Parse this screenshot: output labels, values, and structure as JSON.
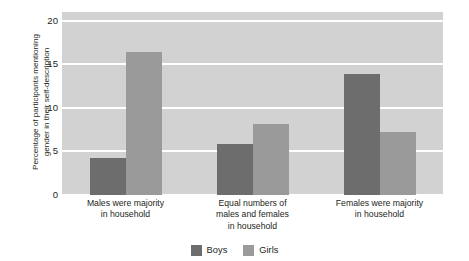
{
  "chart_data": {
    "type": "bar",
    "title": "",
    "xlabel": "",
    "ylabel": "Percentage of participants mentioning gender in their self-description",
    "ylabel_line1": "Percentage of participants mentioning",
    "ylabel_line2": "gender in their self-description",
    "categories": [
      "Males were majority in household",
      "Equal numbers of males and females in household",
      "Females were majority in household"
    ],
    "category_lines": [
      [
        "Males were majority",
        "in household"
      ],
      [
        "Equal numbers of",
        "males and females",
        "in household"
      ],
      [
        "Females were majority",
        "in household"
      ]
    ],
    "series": [
      {
        "name": "Boys",
        "color": "#6d6d6d",
        "values": [
          4.2,
          5.9,
          13.9
        ]
      },
      {
        "name": "Girls",
        "color": "#9a9a9a",
        "values": [
          16.4,
          8.2,
          7.2
        ]
      }
    ],
    "ylim": [
      0,
      21
    ],
    "yticks": [
      0,
      5,
      10,
      15,
      20
    ],
    "ytick_labels": [
      "0",
      "5",
      "10",
      "15",
      "20"
    ],
    "grid": true,
    "gridline_color": "#ffffff",
    "plot_background": "#d2d2d2",
    "legend_position": "bottom-center",
    "legend": [
      {
        "label": "Boys",
        "color": "#6d6d6d"
      },
      {
        "label": "Girls",
        "color": "#9a9a9a"
      }
    ]
  }
}
